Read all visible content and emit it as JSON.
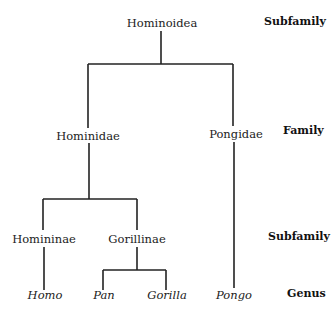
{
  "tree": {
    "root": {
      "label": "Hominoidea",
      "rank": "Subfamily"
    },
    "families": [
      {
        "label": "Hominidae"
      },
      {
        "label": "Pongidae"
      }
    ],
    "subfamilies": [
      {
        "label": "Homininae"
      },
      {
        "label": "Gorillinae"
      }
    ],
    "genera": [
      {
        "label": "Homo"
      },
      {
        "label": "Pan"
      },
      {
        "label": "Gorilla"
      },
      {
        "label": "Pongo"
      }
    ]
  },
  "ranks": {
    "top": "Subfamily",
    "family": "Family",
    "subfamily": "Subfamily",
    "genus": "Genus"
  }
}
